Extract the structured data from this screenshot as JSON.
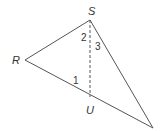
{
  "diagram": {
    "type": "geometry-triangle",
    "points": {
      "S": {
        "label": "S",
        "x": 90,
        "y": 20
      },
      "R": {
        "label": "R",
        "x": 25,
        "y": 60
      },
      "U": {
        "label": "U",
        "x": 90,
        "y": 97
      },
      "T": {
        "label": "",
        "x": 153,
        "y": 128
      }
    },
    "segments": [
      {
        "from": "S",
        "to": "R",
        "style": "solid"
      },
      {
        "from": "R",
        "to": "T",
        "style": "solid"
      },
      {
        "from": "S",
        "to": "T",
        "style": "solid"
      },
      {
        "from": "S",
        "to": "U",
        "style": "dashed"
      }
    ],
    "angle_labels": {
      "one": "1",
      "two": "2",
      "three": "3"
    },
    "vertex_labels": {
      "S": "S",
      "R": "R",
      "U": "U"
    },
    "colors": {
      "line": "#555555",
      "text": "#333333",
      "background": "#ffffff"
    }
  }
}
